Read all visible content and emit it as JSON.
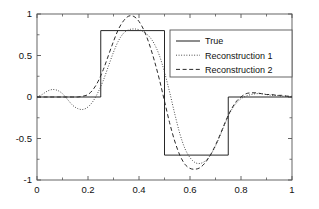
{
  "chart_data": {
    "type": "line",
    "title": "",
    "xlabel": "",
    "ylabel": "",
    "xlim": [
      0,
      1
    ],
    "ylim": [
      -1,
      1
    ],
    "grid": false,
    "legend_position": "upper right",
    "xticks": [
      "0",
      "0.2",
      "0.4",
      "0.6",
      "0.8",
      "1"
    ],
    "xtick_values": [
      0,
      0.2,
      0.4,
      0.6,
      0.8,
      1
    ],
    "yticks": [
      "1",
      "0.5",
      "0",
      "-0.5",
      "-1"
    ],
    "ytick_values": [
      1,
      0.5,
      0,
      -0.5,
      -1
    ],
    "series": [
      {
        "name": "True",
        "style": "solid",
        "color": "#1a1a1a",
        "x": [
          0,
          0.25,
          0.25,
          0.5,
          0.5,
          0.75,
          0.75,
          1
        ],
        "values": [
          0,
          0,
          0.8,
          0.8,
          -0.7,
          -0.7,
          0,
          0
        ]
      },
      {
        "name": "Reconstruction 1",
        "style": "dotted",
        "color": "#3a3a3a",
        "x": [
          0,
          0.02,
          0.04,
          0.06,
          0.08,
          0.1,
          0.12,
          0.14,
          0.16,
          0.18,
          0.2,
          0.22,
          0.24,
          0.26,
          0.28,
          0.3,
          0.32,
          0.34,
          0.36,
          0.38,
          0.4,
          0.42,
          0.44,
          0.46,
          0.48,
          0.5,
          0.52,
          0.54,
          0.56,
          0.58,
          0.6,
          0.62,
          0.64,
          0.66,
          0.68,
          0.7,
          0.72,
          0.74,
          0.76,
          0.78,
          0.8,
          0.82,
          0.84,
          0.86,
          0.88,
          0.9,
          0.92,
          0.94,
          0.96,
          0.98,
          1
        ],
        "values": [
          0,
          0.03,
          0.07,
          0.09,
          0.08,
          0.04,
          -0.03,
          -0.1,
          -0.14,
          -0.15,
          -0.12,
          -0.05,
          0.06,
          0.2,
          0.37,
          0.54,
          0.68,
          0.77,
          0.81,
          0.82,
          0.81,
          0.78,
          0.73,
          0.64,
          0.5,
          0.3,
          0.06,
          -0.2,
          -0.44,
          -0.62,
          -0.73,
          -0.79,
          -0.8,
          -0.77,
          -0.7,
          -0.59,
          -0.45,
          -0.3,
          -0.17,
          -0.08,
          -0.02,
          0.01,
          0.03,
          0.04,
          0.04,
          0.03,
          0.02,
          0.02,
          0.01,
          0.01,
          0
        ]
      },
      {
        "name": "Reconstruction 2",
        "style": "dashed",
        "color": "#2a2a2a",
        "x": [
          0,
          0.02,
          0.04,
          0.06,
          0.08,
          0.1,
          0.12,
          0.14,
          0.16,
          0.18,
          0.2,
          0.22,
          0.24,
          0.26,
          0.28,
          0.3,
          0.32,
          0.34,
          0.36,
          0.38,
          0.4,
          0.42,
          0.44,
          0.46,
          0.48,
          0.5,
          0.52,
          0.54,
          0.56,
          0.58,
          0.6,
          0.62,
          0.64,
          0.66,
          0.68,
          0.7,
          0.72,
          0.74,
          0.76,
          0.78,
          0.8,
          0.82,
          0.84,
          0.86,
          0.88,
          0.9,
          0.92,
          0.94,
          0.96,
          0.98,
          1
        ],
        "values": [
          0,
          0.0,
          0.0,
          0.0,
          0.0,
          0.0,
          0.0,
          0.0,
          0.0,
          0.01,
          0.03,
          0.09,
          0.19,
          0.33,
          0.5,
          0.67,
          0.82,
          0.92,
          0.975,
          0.97,
          0.91,
          0.8,
          0.64,
          0.44,
          0.21,
          -0.05,
          -0.31,
          -0.53,
          -0.7,
          -0.81,
          -0.86,
          -0.87,
          -0.85,
          -0.79,
          -0.7,
          -0.58,
          -0.44,
          -0.29,
          -0.16,
          -0.06,
          0.0,
          0.04,
          0.05,
          0.05,
          0.04,
          0.03,
          0.03,
          0.02,
          0.02,
          0.01,
          0.01
        ]
      }
    ]
  },
  "legend": {
    "entries": [
      {
        "label": "True",
        "style": "solid"
      },
      {
        "label": "Reconstruction 1",
        "style": "dotted"
      },
      {
        "label": "Reconstruction 2",
        "style": "dashed"
      }
    ]
  },
  "axes": {
    "frame_color": "#555555"
  }
}
